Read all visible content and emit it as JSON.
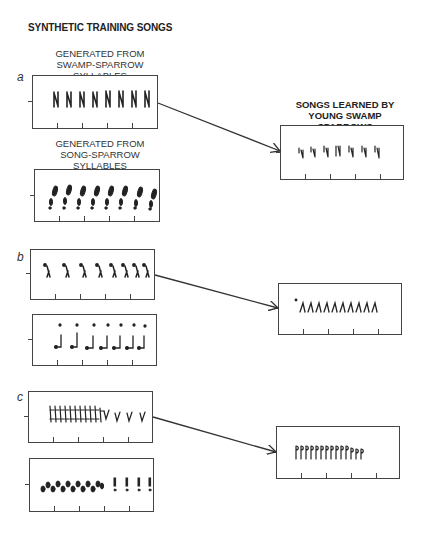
{
  "title": "SYNTHETIC TRAINING SONGS",
  "captions": {
    "swamp": [
      "GENERATED FROM",
      "SWAMP-SPARROW SYLLABLES"
    ],
    "song": [
      "GENERATED FROM",
      "SONG-SPARROW SYLLABLES"
    ],
    "learned": [
      "SONGS LEARNED BY",
      "YOUNG SWAMP SPARROWS"
    ]
  },
  "panels": [
    {
      "label": "a",
      "training_swamp": {
        "glyph": "N",
        "count": 8,
        "description": "swamp-sparrow syllables, evenly spaced"
      },
      "training_song": {
        "glyph": "!",
        "count": 8,
        "description": "song-sparrow syllables, evenly spaced"
      },
      "learned": {
        "glyph": "Ϟ",
        "count": 7,
        "description": "learned from swamp-sparrow syllables"
      }
    },
    {
      "label": "b",
      "training_swamp": {
        "glyph": "ʎ",
        "count": 8,
        "description": "swamp syllables with accelerating tempo"
      },
      "training_song": {
        "glyph": "ɹ",
        "count": 7,
        "description": "song syllables with dots above"
      },
      "learned": {
        "glyph": "ʎ",
        "count": 10,
        "description": "learned even-tempo trill"
      }
    },
    {
      "label": "c",
      "training_swamp": {
        "glyph": "Ý",
        "count": 14,
        "description": "dense trill followed by 4 spaced syllables"
      },
      "training_song": {
        "glyph": "ø",
        "count": 13,
        "description": "song syllables trill then 4 spaced"
      },
      "learned": {
        "glyph": "ɲ",
        "count": 14,
        "description": "learned dense trill"
      }
    }
  ],
  "colors": {
    "ink": "#222222",
    "frame": "#444444",
    "background": "#ffffff"
  }
}
